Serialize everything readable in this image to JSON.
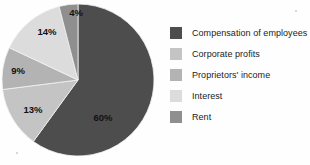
{
  "chart_data": {
    "type": "pie",
    "title": "",
    "legend_position": "right",
    "categories": [
      "Compensation of employees",
      "Corporate profits",
      "Proprietors' income",
      "Interest",
      "Rent"
    ],
    "values": [
      60,
      13,
      9,
      14,
      4
    ],
    "value_labels": [
      "60%",
      "13%",
      "9%",
      "14%",
      "4%"
    ],
    "colors": [
      "#4d4d4d",
      "#c4c4c4",
      "#b3b3b3",
      "#dcdcdc",
      "#8f8f8f"
    ],
    "units": "percent",
    "start_angle_deg": 0,
    "direction": "clockwise"
  },
  "legend": {
    "items": [
      {
        "label": "Compensation of employees",
        "color": "#4d4d4d",
        "value_label": "60%"
      },
      {
        "label": "Corporate profits",
        "color": "#c4c4c4",
        "value_label": "13%"
      },
      {
        "label": "Proprietors' income",
        "color": "#b3b3b3",
        "value_label": "9%"
      },
      {
        "label": "Interest",
        "color": "#dcdcdc",
        "value_label": "14%"
      },
      {
        "label": "Rent",
        "color": "#8f8f8f",
        "value_label": "4%"
      }
    ]
  },
  "pie": {
    "center_x": 78,
    "center_y": 80,
    "radius": 76,
    "slices": [
      {
        "name": "Compensation of employees",
        "value_label": "60%",
        "color": "#4d4d4d",
        "label_x": 103,
        "label_y": 118
      },
      {
        "name": "Corporate profits",
        "value_label": "13%",
        "color": "#c4c4c4",
        "label_x": 33,
        "label_y": 110
      },
      {
        "name": "Proprietors' income",
        "value_label": "9%",
        "color": "#b3b3b3",
        "label_x": 18,
        "label_y": 71
      },
      {
        "name": "Interest",
        "value_label": "14%",
        "color": "#dcdcdc",
        "label_x": 47,
        "label_y": 32
      },
      {
        "name": "Rent",
        "value_label": "4%",
        "color": "#8f8f8f",
        "label_x": 76,
        "label_y": 13
      }
    ]
  }
}
